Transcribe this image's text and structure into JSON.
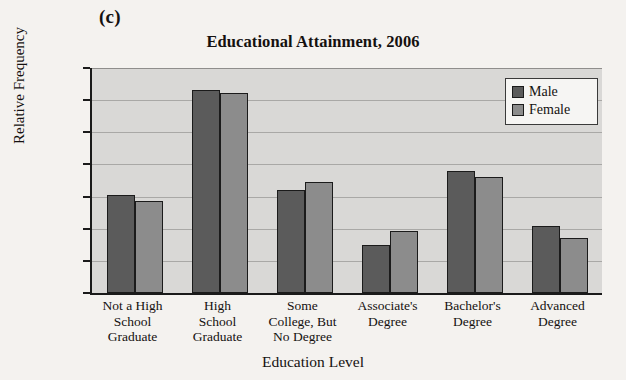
{
  "panel": {
    "letter": "(c)"
  },
  "legend_position": "top-right",
  "chart_data": {
    "type": "bar",
    "title": "Educational Attainment, 2006",
    "xlabel": "Education Level",
    "ylabel": "Relative Frequency",
    "ylim": [
      0.0,
      0.35
    ],
    "ytick_labels": [
      "0.000",
      "0.050",
      "0.100",
      "0.150",
      "0.200",
      "0.250",
      "0.300",
      "0.350"
    ],
    "ytick_values": [
      0.0,
      0.05,
      0.1,
      0.15,
      0.2,
      0.25,
      0.3,
      0.35
    ],
    "grid": true,
    "categories": [
      "Not a High\nSchool\nGraduate",
      "High\nSchool\nGraduate",
      "Some\nCollege, But\nNo Degree",
      "Associate's\nDegree",
      "Bachelor's\nDegree",
      "Advanced\nDegree"
    ],
    "series": [
      {
        "name": "Male",
        "color": "#5b5b5b",
        "values": [
          0.152,
          0.316,
          0.161,
          0.074,
          0.19,
          0.105
        ]
      },
      {
        "name": "Female",
        "color": "#8c8c8c",
        "values": [
          0.143,
          0.311,
          0.172,
          0.097,
          0.181,
          0.085
        ]
      }
    ]
  }
}
